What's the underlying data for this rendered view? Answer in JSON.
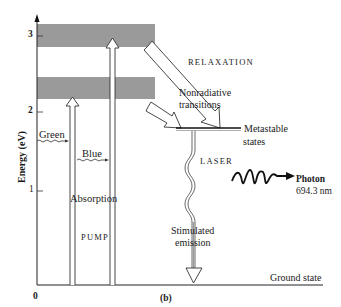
{
  "figure": {
    "panel_label": "(b)",
    "y_axis": {
      "title": "Energy (eV)",
      "ticks": [
        "0",
        "1",
        "2",
        "3"
      ]
    },
    "labels": {
      "green": "Green",
      "blue": "Blue",
      "absorption": "Absorption",
      "pump": "PUMP",
      "relaxation": "RELAXATION",
      "nonradiative_line1": "Nonradiative",
      "nonradiative_line2": "transitions",
      "metastable_line1": "Metastable",
      "metastable_line2": "states",
      "laser": "LASER",
      "photon": "Photon",
      "wavelength": "694.3 nm",
      "stimulated_line1": "Stimulated",
      "stimulated_line2": "emission",
      "ground_state": "Ground state"
    },
    "colors": {
      "band": "#9a9a9a",
      "line": "#222222",
      "background": "#ffffff"
    },
    "energy_bands": [
      {
        "name": "upper-absorption-band",
        "range_eV": [
          2.8,
          3.1
        ]
      },
      {
        "name": "lower-absorption-band",
        "range_eV": [
          2.1,
          2.5
        ]
      }
    ],
    "metastable_level_eV": 1.8
  }
}
